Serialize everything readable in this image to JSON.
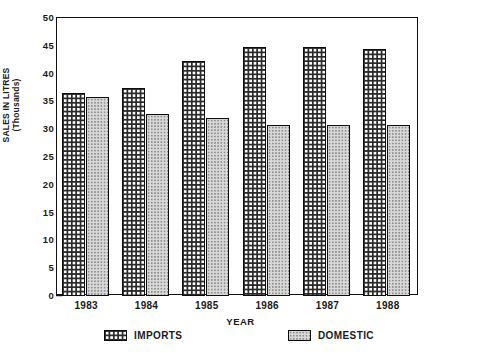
{
  "scan": {
    "cut_title": ""
  },
  "chart_data": {
    "type": "bar",
    "title": "",
    "xlabel": "YEAR",
    "ylabel": "SALES IN LITRES (Thousands)",
    "ylabel_line1": "SALES IN LITRES",
    "ylabel_line2": "(Thousands)",
    "categories": [
      "1983",
      "1984",
      "1985",
      "1986",
      "1987",
      "1988"
    ],
    "series": [
      {
        "name": "IMPORTS",
        "values": [
          36.5,
          37.5,
          42.2,
          44.7,
          44.7,
          44.5
        ]
      },
      {
        "name": "DOMESTIC",
        "values": [
          35.8,
          32.7,
          32.1,
          30.8,
          30.8,
          30.7
        ]
      }
    ],
    "ylim": [
      0,
      50
    ],
    "yticks": [
      0,
      5,
      10,
      15,
      20,
      25,
      30,
      35,
      40,
      45,
      50
    ],
    "ytick_labels": [
      "0",
      "5",
      "10",
      "15",
      "20",
      "25",
      "30",
      "35",
      "40",
      "45",
      "50"
    ],
    "y_minor_step": 1.25,
    "grid": false,
    "legend_position": "bottom",
    "colors": {
      "imports_fill": "#2b2b2b",
      "domestic_fill": "#d8d8d8",
      "outline": "#0d0d0d",
      "axis": "#111111",
      "background": "#ffffff"
    }
  },
  "legend": {
    "items": [
      {
        "label": "IMPORTS",
        "swatch": "checkerboard-pattern-swatch"
      },
      {
        "label": "DOMESTIC",
        "swatch": "stipple-pattern-swatch"
      }
    ]
  }
}
